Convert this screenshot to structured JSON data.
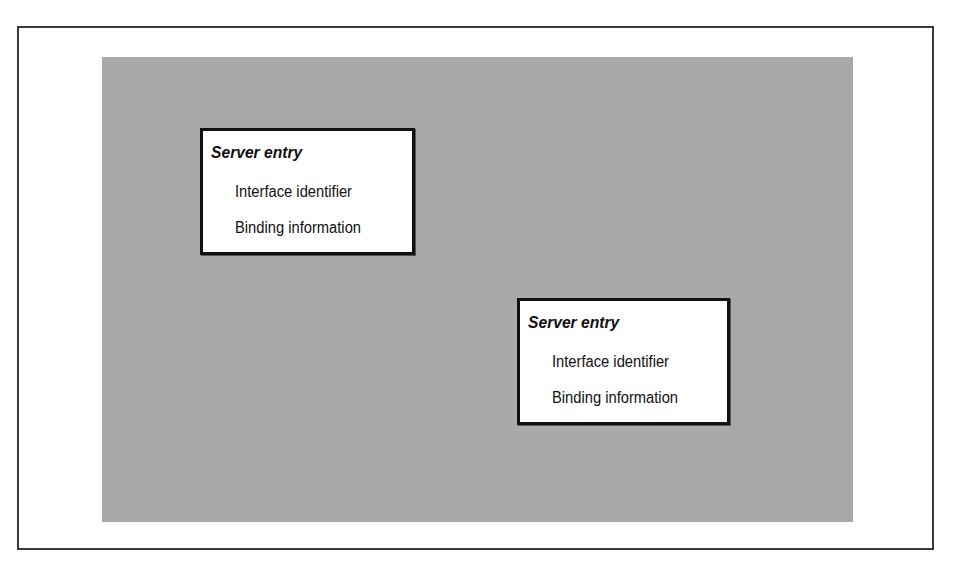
{
  "diagram": {
    "colors": {
      "background": "#ffffff",
      "frame_border": "#3a3a3a",
      "panel": "#a9a9a9",
      "box_fill": "#ffffff",
      "box_border": "#111111",
      "text": "#111111"
    },
    "entries": [
      {
        "title": "Server entry",
        "fields": [
          "Interface identifier",
          "Binding information"
        ]
      },
      {
        "title": "Server entry",
        "fields": [
          "Interface identifier",
          "Binding information"
        ]
      }
    ]
  }
}
